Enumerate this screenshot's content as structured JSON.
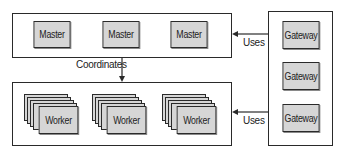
{
  "diagram": {
    "masters": {
      "nodes": [
        {
          "label": "Master"
        },
        {
          "label": "Master"
        },
        {
          "label": "Master"
        }
      ]
    },
    "workers": {
      "nodes": [
        {
          "label": "Worker",
          "stack_depth": 5
        },
        {
          "label": "Worker",
          "stack_depth": 5
        },
        {
          "label": "Worker",
          "stack_depth": 5
        }
      ]
    },
    "gateways": {
      "nodes": [
        {
          "label": "Gateway"
        },
        {
          "label": "Gateway"
        },
        {
          "label": "Gateway"
        }
      ]
    },
    "edges": [
      {
        "from": "gateways",
        "to": "masters",
        "label": "Uses"
      },
      {
        "from": "gateways",
        "to": "workers",
        "label": "Uses"
      },
      {
        "from": "masters",
        "to": "workers",
        "label": "Coordinates"
      }
    ],
    "colors": {
      "node_fill": "#d6d6d6",
      "stroke": "#2a2a2a",
      "background": "#ffffff"
    }
  }
}
